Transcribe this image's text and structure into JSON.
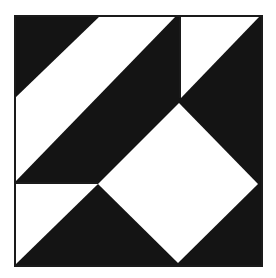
{
  "figure": {
    "colors": {
      "dark": "#141414",
      "light": "#ffffff",
      "frame": "#1a1a1a"
    },
    "frame": {
      "x": 15,
      "y": 16,
      "width": 247,
      "height": 250
    },
    "shapes": [
      {
        "name": "black-background",
        "fill": "dark",
        "points": "15,16 262,16 262,266 15,266"
      },
      {
        "name": "white-diagonal-band",
        "fill": "light",
        "points": "15,98 100,16 176,16 15,182"
      },
      {
        "name": "white-top-right-triangle",
        "fill": "light",
        "points": "181,17 259,17 181,98"
      },
      {
        "name": "white-diamond",
        "fill": "light",
        "points": "179,103 258,184 178,263 98,184"
      },
      {
        "name": "white-bottom-left-triangle",
        "fill": "light",
        "points": "16,184 98,184 16,264"
      }
    ],
    "dividers": [
      {
        "name": "vertical-divider",
        "x1": 180,
        "y1": 16,
        "x2": 180,
        "y2": 98
      },
      {
        "name": "horizontal-divider",
        "x1": 15,
        "y1": 183,
        "x2": 98,
        "y2": 183
      }
    ]
  }
}
